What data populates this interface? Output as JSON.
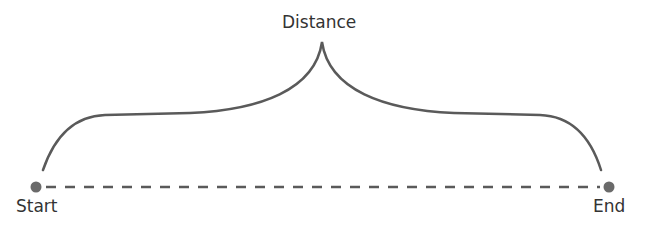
{
  "diagram": {
    "title_label": "Distance",
    "start_label": "Start",
    "end_label": "End",
    "colors": {
      "line": "#5a5a5a",
      "point": "#6a6a6a",
      "text": "#333333"
    }
  }
}
